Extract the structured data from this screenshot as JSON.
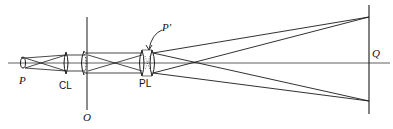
{
  "diagram": {
    "type": "optical-ray-diagram",
    "labels": {
      "source": "P",
      "condenser_lens": "CL",
      "object_plane": "O",
      "projection_lens": "PL",
      "pupil_image": "P'",
      "screen": "Q"
    },
    "colors": {
      "line": "#1a1a1a",
      "background": "#ffffff"
    }
  }
}
